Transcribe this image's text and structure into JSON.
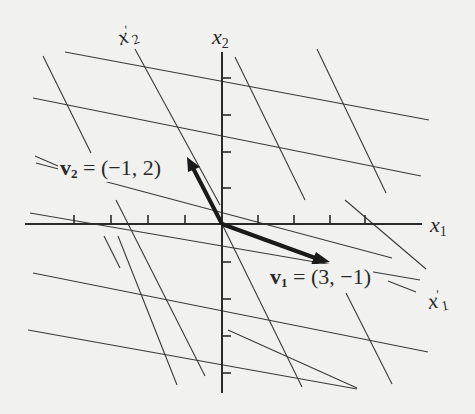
{
  "figure": {
    "colors": {
      "background": "#f1f1f0",
      "ink": "#2a2a2a",
      "grid": "#3a3a3a"
    },
    "axes": {
      "x_label": {
        "var": "x",
        "sub": "1"
      },
      "y_label": {
        "var": "x",
        "sub": "2"
      },
      "x_ticks": [
        -5,
        -4,
        -3,
        -2,
        -1,
        1,
        2,
        3,
        4,
        5
      ],
      "y_ticks": [
        -4,
        -3,
        -2,
        -1,
        1,
        2,
        3,
        4
      ]
    },
    "oblique_axes": {
      "x1_prime": {
        "var": "x",
        "sub": "1",
        "prime": "′"
      },
      "x2_prime": {
        "var": "x",
        "sub": "2",
        "prime": "′"
      }
    },
    "vectors": [
      {
        "name": "v",
        "sub": "1",
        "eq": "=",
        "value": "(3, −1)",
        "components": [
          3,
          -1
        ]
      },
      {
        "name": "v",
        "sub": "2",
        "eq": "=",
        "value": "(−1, 2)",
        "components": [
          -1,
          2
        ]
      }
    ],
    "grid_description": "Oblique coordinate grid with lines parallel to v1 = (3,-1) and v2 = (-1,2)"
  }
}
